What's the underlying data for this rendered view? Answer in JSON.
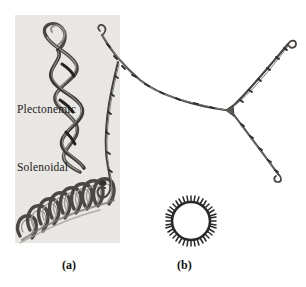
{
  "figure": {
    "background_color": "#ffffff",
    "panel_background_color": "#e9e7e4",
    "strand_color": "#555250",
    "strand_dark_color": "#2f2d2c",
    "panels": [
      {
        "id": "a",
        "caption": "(a)",
        "labels": [
          {
            "id": "plectonemic",
            "text": "Plectonemic"
          },
          {
            "id": "solenoidal",
            "text": "Solenoidal"
          }
        ]
      },
      {
        "id": "b",
        "caption": "(b)",
        "labels": []
      }
    ],
    "elements": {
      "plectonemic_coil": "interwound-double-helix",
      "solenoidal_coil": "toroidal-helix",
      "branched_strand": "y-junction-duplex",
      "relaxed_circle": "circular-dna-ring"
    }
  },
  "captions": {
    "a": "(a)",
    "b": "(b)"
  },
  "labels": {
    "plectonemic": "Plectonemic",
    "solenoidal": "Solenoidal"
  }
}
